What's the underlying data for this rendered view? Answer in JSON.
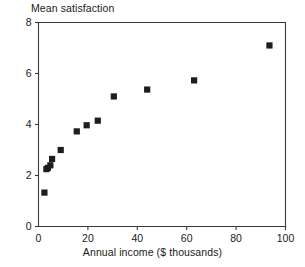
{
  "chart_data": {
    "type": "scatter",
    "title": "",
    "ylabel": "Mean satisfaction",
    "xlabel": "Annual income ($ thousands)",
    "xlim": [
      0,
      100
    ],
    "ylim": [
      0,
      8
    ],
    "xticks": [
      0,
      20,
      40,
      60,
      80,
      100
    ],
    "yticks": [
      0,
      2,
      4,
      6,
      8
    ],
    "xtick_labels": [
      "0",
      "20",
      "40",
      "60",
      "80",
      "100"
    ],
    "ytick_labels": [
      "0",
      "2",
      "4",
      "6",
      "8"
    ],
    "grid": false,
    "legend": false,
    "marker": "square",
    "marker_color": "#1d1d1d",
    "x": [
      2.4,
      3.2,
      3.8,
      4.8,
      5.5,
      9.0,
      15.5,
      19.5,
      24.0,
      30.5,
      44.0,
      63.0,
      93.5
    ],
    "y": [
      1.33,
      2.25,
      2.3,
      2.4,
      2.65,
      3.0,
      3.73,
      3.97,
      4.15,
      5.1,
      5.37,
      5.73,
      7.1
    ],
    "points": [
      {
        "x": 2.4,
        "y": 1.33
      },
      {
        "x": 3.2,
        "y": 2.25
      },
      {
        "x": 3.8,
        "y": 2.3
      },
      {
        "x": 4.8,
        "y": 2.4
      },
      {
        "x": 5.5,
        "y": 2.65
      },
      {
        "x": 9.0,
        "y": 3.0
      },
      {
        "x": 15.5,
        "y": 3.73
      },
      {
        "x": 19.5,
        "y": 3.97
      },
      {
        "x": 24.0,
        "y": 4.15
      },
      {
        "x": 30.5,
        "y": 5.1
      },
      {
        "x": 44.0,
        "y": 5.37
      },
      {
        "x": 63.0,
        "y": 5.73
      },
      {
        "x": 93.5,
        "y": 7.1
      }
    ]
  },
  "labels": {
    "y_axis_title": "Mean satisfaction",
    "x_axis_title": "Annual income ($ thousands)"
  },
  "colors": {
    "marker": "#1d1d1d",
    "axis": "#3a3a3a",
    "text": "#1a1a1a",
    "background": "#ffffff"
  }
}
